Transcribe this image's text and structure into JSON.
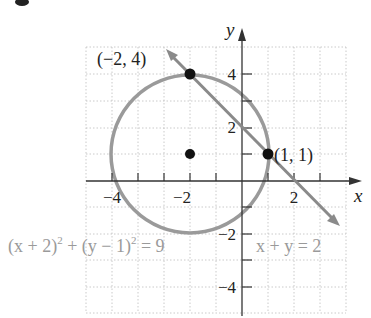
{
  "graph": {
    "axes": {
      "x_label": "x",
      "y_label": "y",
      "x_ticks": [
        {
          "value": -4,
          "label": "−4"
        },
        {
          "value": -2,
          "label": "−2"
        },
        {
          "value": 2,
          "label": "2"
        }
      ],
      "y_ticks": [
        {
          "value": 4,
          "label": "4"
        },
        {
          "value": 2,
          "label": "2"
        },
        {
          "value": -2,
          "label": "−2"
        },
        {
          "value": -4,
          "label": "−4"
        }
      ],
      "xlim": [
        -6,
        4
      ],
      "ylim": [
        -5,
        5
      ],
      "grid": "dotted, 1 unit"
    },
    "circle": {
      "equation": "(x + 2)² + (y − 1)² = 9",
      "center": [
        -2,
        1
      ],
      "radius": 3,
      "color": "#9a9a9a"
    },
    "line": {
      "equation": "x + y = 2",
      "color": "#8a8a8a"
    },
    "points": [
      {
        "label": "(−2, 4)",
        "x": -2,
        "y": 4
      },
      {
        "label": "(1, 1)",
        "x": 1,
        "y": 1
      },
      {
        "label": "",
        "x": -2,
        "y": 1
      }
    ],
    "labels": {
      "point_a": "(−2, 4)",
      "point_b": "(1, 1)",
      "circle_eq_main": "(x + 2)",
      "circle_eq_mid": " + (y − 1)",
      "circle_eq_end": " = 9",
      "line_eq": "x + y = 2",
      "sup": "2"
    }
  }
}
